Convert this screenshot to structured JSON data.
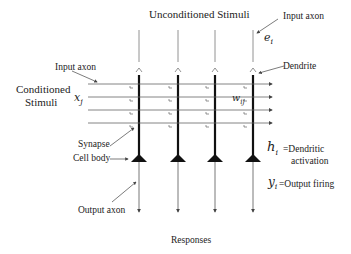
{
  "title": "Unconditioned Stimuli",
  "labels": {
    "input_axon_top": "Input axon",
    "input_axon_left": "Input axon",
    "e_i": "e",
    "e_i_sub": "i",
    "dendrite": "Dendrite",
    "conditioned_line1": "Conditioned",
    "conditioned_line2": "Stimuli",
    "x_j": "x",
    "x_j_sub": "j",
    "w_ij": "w",
    "w_ij_sub": "ij",
    "synapse": "Synapse",
    "cell_body": "Cell body",
    "output_axon": "Output axon",
    "h_i": "h",
    "h_i_sub": "i",
    "h_desc_1": "=Dendritic",
    "h_desc_2": "activation",
    "y_i": "y",
    "y_i_sub": "i",
    "y_desc": "=Output firing",
    "responses": "Responses"
  },
  "structure": {
    "neuron_columns_x": [
      139,
      178,
      215,
      253
    ],
    "input_rows_y": [
      84,
      97,
      110,
      123
    ],
    "line_color": "#555555",
    "dendrite_color": "#111111"
  }
}
